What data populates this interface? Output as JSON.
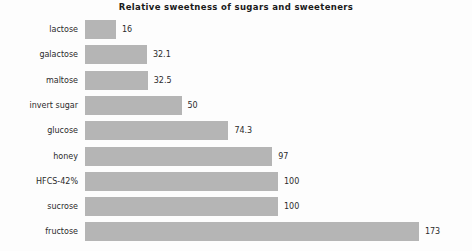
{
  "chart_data": {
    "type": "bar",
    "orientation": "horizontal",
    "title": "Relative sweetness of sugars and sweeteners",
    "xlabel": "",
    "ylabel": "",
    "grid": false,
    "legend": "none",
    "xlim": [
      0,
      173
    ],
    "categories": [
      "lactose",
      "galactose",
      "maltose",
      "invert sugar",
      "glucose",
      "honey",
      "HFCS-42%",
      "sucrose",
      "fructose"
    ],
    "values": [
      16,
      32.1,
      32.5,
      50,
      74.3,
      97,
      100,
      100,
      173
    ],
    "value_labels": [
      "16",
      "32.1",
      "32.5",
      "50",
      "74.3",
      "97",
      "100",
      "100",
      "173"
    ],
    "bar_color": "#b5b5b5",
    "background_color": "#fdfdfd",
    "text_color": "#2b2b2b"
  },
  "layout": {
    "bar_origin_x": 85,
    "pixels_per_unit": 1.93,
    "row_pitch": 25.3,
    "bar_height": 19,
    "label_gap": 6
  }
}
